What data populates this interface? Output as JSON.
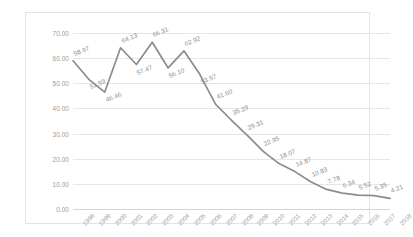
{
  "chart_data": {
    "type": "line",
    "title": "",
    "subtitle": "",
    "xlabel": "",
    "ylabel": "",
    "categories": [
      "1998",
      "1999",
      "2000",
      "2001",
      "2002",
      "2003",
      "2004",
      "2005",
      "2006",
      "2007",
      "2008",
      "2009",
      "2010",
      "2011",
      "2012",
      "2013",
      "2014",
      "2015",
      "2016",
      "2017",
      "2018"
    ],
    "values": [
      58.97,
      51.59,
      46.46,
      64.13,
      57.47,
      66.31,
      56.1,
      62.92,
      53.57,
      41.6,
      35.29,
      29.31,
      22.95,
      18.07,
      14.87,
      10.83,
      7.78,
      6.34,
      5.52,
      5.35,
      4.21
    ],
    "data_labels": [
      "58.97",
      "51.59",
      "46.46",
      "64.13",
      "57.47",
      "66.31",
      "56.10",
      "62.92",
      "53.57",
      "41.60",
      "35.29",
      "29.31",
      "22.95",
      "18.07",
      "14.87",
      "10.83",
      "7.78",
      "6.34",
      "5.52",
      "5.35",
      "4.21"
    ],
    "ylim": [
      0,
      70
    ],
    "ytick_step": 10,
    "ytick_labels": [
      "70.00",
      "60.00",
      "50.00",
      "40.00",
      "30.00",
      "20.00",
      "10.00",
      "0.00"
    ],
    "ytick_values": [
      70,
      60,
      50,
      40,
      30,
      20,
      10,
      0
    ],
    "grid": true,
    "legend": false,
    "legend_position": "none",
    "series_color": "#8c8c8c",
    "grid_color": "#e6e6e6",
    "label_color": "#8d8d8d",
    "tick_color": "#9a9a9a",
    "frame_color": "#e3e3e3",
    "series": [
      {
        "name": "series-1",
        "values": [
          58.97,
          51.59,
          46.46,
          64.13,
          57.47,
          66.31,
          56.1,
          62.92,
          53.57,
          41.6,
          35.29,
          29.31,
          22.95,
          18.07,
          14.87,
          10.83,
          7.78,
          6.34,
          5.52,
          5.35,
          4.21
        ]
      }
    ]
  }
}
